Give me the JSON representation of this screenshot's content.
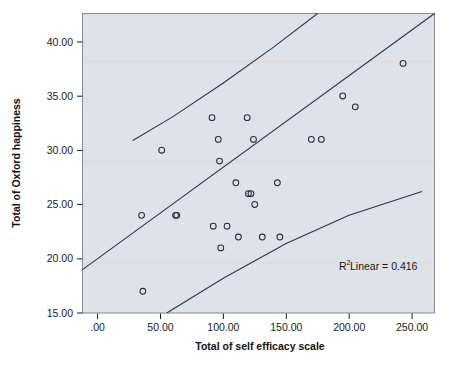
{
  "chart_data": {
    "type": "scatter",
    "title": "",
    "xlabel": "Total of self efficacy scale",
    "ylabel": "Total of Oxford happiness",
    "xlim": [
      -12,
      268
    ],
    "ylim": [
      15.0,
      42.6
    ],
    "xticks": [
      0,
      50,
      100,
      150,
      200,
      250
    ],
    "xtick_labels": [
      ".00",
      "50.00",
      "100.00",
      "150.00",
      "200.00",
      "250.00"
    ],
    "yticks": [
      15,
      20,
      25,
      30,
      35,
      40
    ],
    "ytick_labels": [
      "15.00",
      "20.00",
      "25.00",
      "30.00",
      "35.00",
      "40.00"
    ],
    "grid": false,
    "legend": "none",
    "annotation": "R² Linear = 0.416",
    "annotation_base": "R",
    "annotation_sup": "2",
    "annotation_rest": " Linear = 0.416",
    "r_squared": 0.416,
    "points": [
      {
        "x": 35,
        "y": 24
      },
      {
        "x": 36,
        "y": 17
      },
      {
        "x": 51,
        "y": 30
      },
      {
        "x": 62,
        "y": 24
      },
      {
        "x": 63,
        "y": 24
      },
      {
        "x": 91,
        "y": 33
      },
      {
        "x": 92,
        "y": 23
      },
      {
        "x": 96,
        "y": 31
      },
      {
        "x": 97,
        "y": 29
      },
      {
        "x": 98,
        "y": 21
      },
      {
        "x": 103,
        "y": 23
      },
      {
        "x": 110,
        "y": 27
      },
      {
        "x": 112,
        "y": 22
      },
      {
        "x": 119,
        "y": 33
      },
      {
        "x": 120,
        "y": 26
      },
      {
        "x": 122,
        "y": 26
      },
      {
        "x": 124,
        "y": 31
      },
      {
        "x": 125,
        "y": 25
      },
      {
        "x": 131,
        "y": 22
      },
      {
        "x": 143,
        "y": 27
      },
      {
        "x": 145,
        "y": 22
      },
      {
        "x": 170,
        "y": 31
      },
      {
        "x": 178,
        "y": 31
      },
      {
        "x": 195,
        "y": 35
      },
      {
        "x": 205,
        "y": 34
      },
      {
        "x": 243,
        "y": 38
      }
    ],
    "fit_line": {
      "name": "linear regression fit",
      "x_start": -12,
      "y_start": 19.0,
      "x_end": 268,
      "y_end": 43.5,
      "slope": 0.0875,
      "intercept": 20.05
    },
    "confidence_bands": [
      {
        "name": "upper confidence band",
        "points": [
          {
            "x": 28,
            "y": 30.9
          },
          {
            "x": 60,
            "y": 33.1
          },
          {
            "x": 100,
            "y": 36.2
          },
          {
            "x": 140,
            "y": 39.5
          },
          {
            "x": 175,
            "y": 42.6
          }
        ]
      },
      {
        "name": "lower confidence band",
        "points": [
          {
            "x": 55,
            "y": 15.0
          },
          {
            "x": 100,
            "y": 18.2
          },
          {
            "x": 150,
            "y": 21.4
          },
          {
            "x": 200,
            "y": 24.0
          },
          {
            "x": 258,
            "y": 26.2
          }
        ]
      }
    ]
  },
  "axes": {
    "x_title": "Total of self efficacy scale",
    "y_title": "Total of Oxford happiness"
  },
  "annotation": {
    "r2_base": "R",
    "r2_sup": "2",
    "r2_rest": " Linear = 0.416"
  },
  "colors": {
    "plot_background": "#dfe2e8",
    "page_background": "#ffffff",
    "marker_stroke": "#2b2f45",
    "line_stroke": "#2b3350",
    "frame_stroke": "#8a8f99",
    "text": "#1a1a1a"
  }
}
